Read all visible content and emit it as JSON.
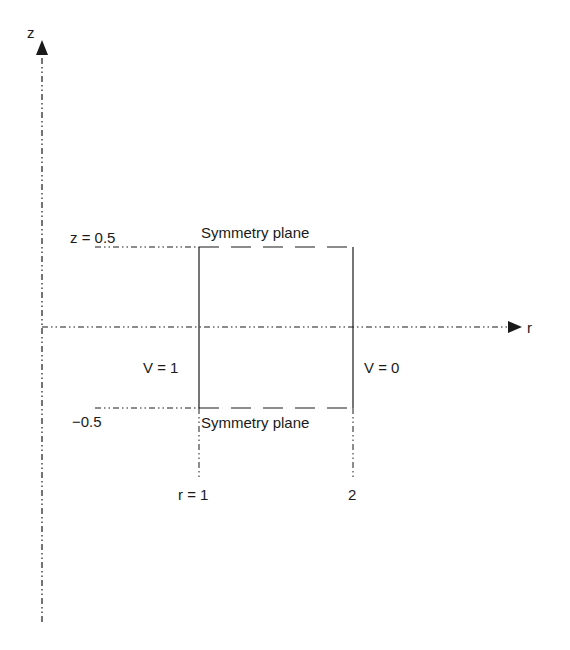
{
  "diagram": {
    "axes": {
      "vertical_label": "z",
      "horizontal_label": "r"
    },
    "z_ticks": {
      "top": "z = 0.5",
      "bottom": "−0.5"
    },
    "r_ticks": {
      "inner": "r = 1",
      "outer": "2"
    },
    "boundaries": {
      "top": "Symmetry plane",
      "bottom": "Symmetry plane",
      "left": "V = 1",
      "right": "V = 0"
    },
    "colors": {
      "line": "#1a1a1a",
      "background": "#ffffff"
    }
  }
}
